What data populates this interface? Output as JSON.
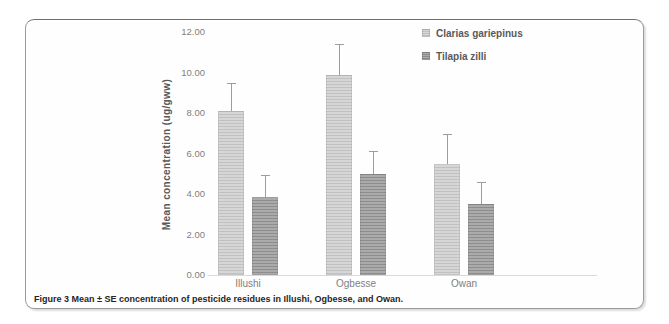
{
  "figure": {
    "caption_label": "Figure 3",
    "caption_text": "Mean ± SE concentration of pesticide residues in Illushi, Ogbesse, and Owan."
  },
  "chart_data": {
    "type": "bar",
    "title": "",
    "xlabel": "",
    "ylabel": "Mean concentration (ug/gww)",
    "categories": [
      "Illushi",
      "Ogbesse",
      "Owan"
    ],
    "series": [
      {
        "name": "Clarias gariepinus",
        "values": [
          8.1,
          9.9,
          5.5
        ],
        "se": [
          1.4,
          1.5,
          1.45
        ],
        "color": "#d6d6d6",
        "stripe_color": "#c1c1c1"
      },
      {
        "name": "Tilapia zilli",
        "values": [
          3.85,
          5.0,
          3.5
        ],
        "se": [
          1.1,
          1.1,
          1.1
        ],
        "color": "#ababab",
        "stripe_color": "#8d8d8d"
      }
    ],
    "ylim": [
      0,
      12
    ],
    "ytick_step": 2,
    "ytick_labels": [
      "0.00",
      "2.00",
      "4.00",
      "6.00",
      "8.00",
      "10.00",
      "12.00"
    ],
    "error_bars": "plus_direction_only",
    "error_color": "#9d9d9d",
    "axis_line_color": "#d9d9d9",
    "grid": false,
    "legend_position": "top-right",
    "text_colors": {
      "ticks": "#808080",
      "axis_title": "#595959",
      "legend": "#595959",
      "caption": "#262626"
    }
  }
}
